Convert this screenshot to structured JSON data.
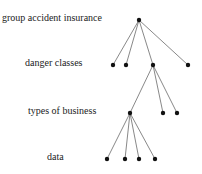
{
  "levels": [
    {
      "label": "group accident insurance",
      "y": 20
    },
    {
      "label": "danger classes",
      "y": 65
    },
    {
      "label": "types of business",
      "y": 113
    },
    {
      "label": "data",
      "y": 159
    }
  ],
  "nodes": [
    {
      "id": "root",
      "x": 139,
      "y": 20
    },
    {
      "id": "l1a",
      "x": 113,
      "y": 65
    },
    {
      "id": "l1b",
      "x": 126,
      "y": 65
    },
    {
      "id": "l1c",
      "x": 153,
      "y": 65
    },
    {
      "id": "l1d",
      "x": 188,
      "y": 65
    },
    {
      "id": "l2a",
      "x": 130,
      "y": 113
    },
    {
      "id": "l2b",
      "x": 163,
      "y": 113
    },
    {
      "id": "l2c",
      "x": 177,
      "y": 113
    },
    {
      "id": "l3a",
      "x": 107,
      "y": 159
    },
    {
      "id": "l3b",
      "x": 125,
      "y": 159
    },
    {
      "id": "l3c",
      "x": 139,
      "y": 159
    },
    {
      "id": "l3d",
      "x": 155,
      "y": 159
    }
  ],
  "edges": [
    [
      "root",
      "l1a"
    ],
    [
      "root",
      "l1b"
    ],
    [
      "root",
      "l1c"
    ],
    [
      "root",
      "l1d"
    ],
    [
      "l1c",
      "l2a"
    ],
    [
      "l1c",
      "l2b"
    ],
    [
      "l1c",
      "l2c"
    ],
    [
      "l2a",
      "l3a"
    ],
    [
      "l2a",
      "l3b"
    ],
    [
      "l2a",
      "l3c"
    ],
    [
      "l2a",
      "l3d"
    ]
  ]
}
